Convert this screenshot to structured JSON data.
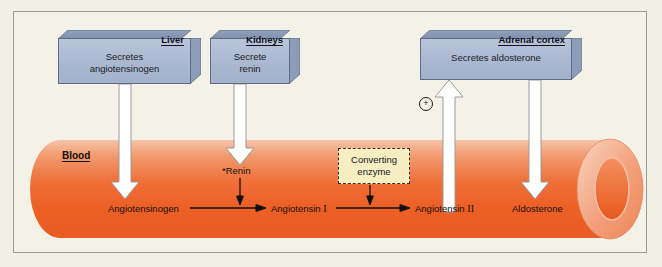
{
  "figure": {
    "background_color": "#f4f2e6",
    "border_color": "#9a9a94"
  },
  "organ_boxes": [
    {
      "id": "liver",
      "label": "Liver",
      "description": "Secretes\nangiotensinogen",
      "face_color": "#aab7d0",
      "edge_color": "#5e6c84"
    },
    {
      "id": "kidneys",
      "label": "Kidneys",
      "description": "Secrete\nrenin",
      "face_color": "#aab7d0",
      "edge_color": "#5e6c84"
    },
    {
      "id": "adrenal_cortex",
      "label": "Adrenal cortex",
      "description": "Secretes aldosterone",
      "face_color": "#aab7d0",
      "edge_color": "#5e6c84"
    }
  ],
  "vessel": {
    "label": "Blood",
    "color_light": "#f3a07a",
    "color_mid": "#ef6a32",
    "color_dark": "#e0561f"
  },
  "enzyme_box": {
    "text": "Converting\nenzyme",
    "fill": "#f7eec2",
    "border": "#33302a",
    "border_style": "dashed"
  },
  "pathway": {
    "renin_label": "*Renin",
    "steps": [
      "Angiotensinogen",
      "Angiotensin I",
      "Angiotensin II",
      "Aldosterone"
    ],
    "angiotensin_1_name": "Angiotensin",
    "angiotensin_1_numeral": "I",
    "angiotensin_2_name": "Angiotensin",
    "angiotensin_2_numeral": "II"
  },
  "annotations": {
    "stimulation_symbol": "+",
    "stimulation_meaning": "stimulates"
  },
  "arrows": {
    "white_arrow_fill": "#ffffff",
    "white_arrow_stroke": "#8a8a8a",
    "black_arrow_color": "#111111"
  }
}
